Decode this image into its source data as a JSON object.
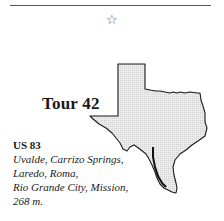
{
  "header": {
    "ornament": "☆",
    "ornament_icon": "star-icon"
  },
  "tour": {
    "title": "Tour 42",
    "highway": "US 83",
    "stops_lines": [
      "Uvalde, Carrizo Springs,",
      "Laredo, Roma,",
      "Rio Grande City, Mission,",
      "268 m."
    ],
    "map_icon": "texas-map-icon",
    "map_fill": "#e4e4e4",
    "outline_color": "#1a1a1a",
    "route_color": "#111111"
  }
}
